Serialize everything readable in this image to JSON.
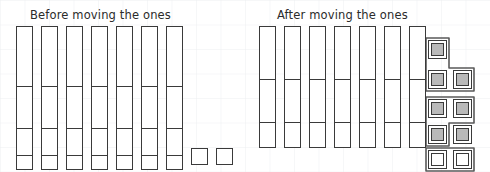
{
  "image": {
    "width": 490,
    "height": 172,
    "background_color": "#ffffff",
    "grid_color": "#eceff1",
    "ink_color": "#3a3a3a",
    "fill_color": "#b9b9b9"
  },
  "panels": [
    {
      "id": "before",
      "title": "Before moving the ones",
      "title_x": 30,
      "title_y": 8,
      "rods": [
        {
          "x": 16,
          "y": 26,
          "w": 17,
          "h": 144,
          "dividers": [
            60,
            102,
            129
          ]
        },
        {
          "x": 41,
          "y": 26,
          "w": 17,
          "h": 144,
          "dividers": [
            60,
            102,
            129
          ]
        },
        {
          "x": 66,
          "y": 26,
          "w": 17,
          "h": 144,
          "dividers": [
            60,
            102,
            129
          ]
        },
        {
          "x": 91,
          "y": 26,
          "w": 17,
          "h": 144,
          "dividers": [
            60,
            102,
            129
          ]
        },
        {
          "x": 116,
          "y": 26,
          "w": 17,
          "h": 144,
          "dividers": [
            60,
            102,
            129
          ]
        },
        {
          "x": 141,
          "y": 26,
          "w": 17,
          "h": 144,
          "dividers": [
            60,
            102,
            129
          ]
        },
        {
          "x": 166,
          "y": 26,
          "w": 17,
          "h": 144,
          "dividers": [
            60,
            102,
            129
          ]
        }
      ],
      "units": [
        {
          "x": 191,
          "y": 148,
          "w": 17,
          "h": 17,
          "style": "plain"
        },
        {
          "x": 216,
          "y": 148,
          "w": 17,
          "h": 17,
          "style": "plain"
        }
      ],
      "groups": []
    },
    {
      "id": "after",
      "title": "After moving the ones",
      "title_x": 277,
      "title_y": 8,
      "rods": [
        {
          "x": 259,
          "y": 26,
          "w": 17,
          "h": 122,
          "dividers": [
            53,
            96
          ]
        },
        {
          "x": 284,
          "y": 26,
          "w": 17,
          "h": 122,
          "dividers": [
            53,
            96
          ]
        },
        {
          "x": 309,
          "y": 26,
          "w": 17,
          "h": 122,
          "dividers": [
            53,
            96
          ]
        },
        {
          "x": 334,
          "y": 26,
          "w": 17,
          "h": 122,
          "dividers": [
            53,
            96
          ]
        },
        {
          "x": 359,
          "y": 26,
          "w": 17,
          "h": 122,
          "dividers": [
            53,
            96
          ]
        },
        {
          "x": 384,
          "y": 26,
          "w": 17,
          "h": 122,
          "dividers": [
            53,
            96
          ]
        },
        {
          "x": 409,
          "y": 26,
          "w": 17,
          "h": 122,
          "dividers": [
            53,
            96
          ]
        }
      ],
      "units": [
        {
          "x": 428,
          "y": 40,
          "w": 19,
          "h": 19,
          "style": "filled"
        },
        {
          "x": 428,
          "y": 70,
          "w": 19,
          "h": 19,
          "style": "filled"
        },
        {
          "x": 453,
          "y": 70,
          "w": 19,
          "h": 19,
          "style": "filled"
        },
        {
          "x": 428,
          "y": 99,
          "w": 19,
          "h": 19,
          "style": "filled"
        },
        {
          "x": 453,
          "y": 99,
          "w": 19,
          "h": 19,
          "style": "filled"
        },
        {
          "x": 428,
          "y": 125,
          "w": 19,
          "h": 19,
          "style": "filled"
        },
        {
          "x": 453,
          "y": 125,
          "w": 19,
          "h": 19,
          "style": "filled"
        },
        {
          "x": 428,
          "y": 150,
          "w": 19,
          "h": 19,
          "style": "hollow"
        },
        {
          "x": 453,
          "y": 150,
          "w": 19,
          "h": 19,
          "style": "hollow"
        }
      ],
      "groups": [
        {
          "name": "group-top",
          "path": "M 426 38 L 449 38 L 449 68 L 474 68 L 474 91 L 426 91 Z"
        },
        {
          "name": "group-middle",
          "path": "M 426 97 L 474 97 L 474 123 L 449 123 L 449 146 L 426 146 Z"
        },
        {
          "name": "group-bottom",
          "path": "M 426 148 L 474 148 L 474 171 L 426 171 Z"
        }
      ]
    }
  ]
}
